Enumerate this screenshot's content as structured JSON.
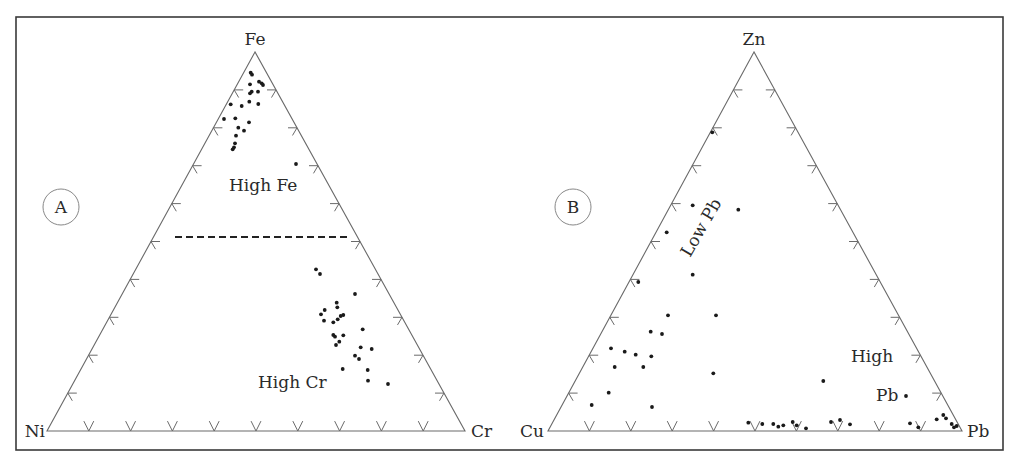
{
  "colors": {
    "background": "#ffffff",
    "frame": "#3a3a3a",
    "axis": "#6a6a6a",
    "point": "#1a1a1a",
    "text": "#2a2a2a"
  },
  "panels": [
    {
      "id": "A",
      "letter": "A",
      "letter_pos": [
        60,
        213
      ],
      "vertices": {
        "top": {
          "label": "Fe",
          "x": 255,
          "y": 52
        },
        "left": {
          "label": "Ni",
          "x": 47,
          "y": 431
        },
        "right": {
          "label": "Cr",
          "x": 465,
          "y": 431
        }
      },
      "regions": [
        {
          "label": "High Fe",
          "x": 229,
          "y": 191,
          "rotate": 0
        },
        {
          "label": "High Cr",
          "x": 258,
          "y": 388,
          "rotate": 0
        }
      ],
      "divider": {
        "style": "dashed",
        "x1": 175,
        "y1": 237,
        "x2": 351,
        "y2": 237
      },
      "points": [
        [
          250.7,
          72.7
        ],
        [
          252,
          74.7
        ],
        [
          259,
          81.7
        ],
        [
          261.7,
          83.3
        ],
        [
          263,
          85
        ],
        [
          250,
          84.3
        ],
        [
          251.7,
          91.7
        ],
        [
          250,
          93.3
        ],
        [
          258,
          91.7
        ],
        [
          249.3,
          101.7
        ],
        [
          258.3,
          104
        ],
        [
          230.7,
          104.3
        ],
        [
          241.7,
          106
        ],
        [
          224,
          119
        ],
        [
          235.3,
          118.3
        ],
        [
          249,
          122.3
        ],
        [
          238.3,
          127.7
        ],
        [
          244,
          130.7
        ],
        [
          236,
          135.7
        ],
        [
          235,
          143.3
        ],
        [
          234,
          147.3
        ],
        [
          232.7,
          149.3
        ],
        [
          296,
          164
        ],
        [
          316,
          269.3
        ],
        [
          320,
          274
        ],
        [
          355,
          294
        ],
        [
          336.7,
          302.7
        ],
        [
          337.3,
          307.3
        ],
        [
          324.7,
          310
        ],
        [
          321,
          314.3
        ],
        [
          343.3,
          315
        ],
        [
          340.7,
          316
        ],
        [
          337.7,
          319.3
        ],
        [
          333.3,
          322.3
        ],
        [
          324,
          320.7
        ],
        [
          362.7,
          329.3
        ],
        [
          333.3,
          335
        ],
        [
          335,
          336.7
        ],
        [
          343.3,
          335.3
        ],
        [
          339.3,
          341.7
        ],
        [
          336,
          345
        ],
        [
          360.7,
          347.3
        ],
        [
          371.7,
          349
        ],
        [
          355,
          355.7
        ],
        [
          359,
          359
        ],
        [
          342.7,
          369
        ],
        [
          367.7,
          370
        ],
        [
          368,
          380.7
        ],
        [
          388,
          384
        ]
      ]
    },
    {
      "id": "B",
      "letter": "B",
      "letter_pos": [
        572,
        213
      ],
      "vertices": {
        "top": {
          "label": "Zn",
          "x": 754,
          "y": 52
        },
        "left": {
          "label": "Cu",
          "x": 548,
          "y": 431
        },
        "right": {
          "label": "Pb",
          "x": 962,
          "y": 431
        }
      },
      "regions": [
        {
          "label": "Low Pb",
          "x": 706,
          "y": 232,
          "rotate": -60
        },
        {
          "label": "High",
          "x": 851,
          "y": 362,
          "rotate": 0
        },
        {
          "label": "Pb",
          "x": 877,
          "y": 401,
          "rotate": 0
        }
      ],
      "divider": null,
      "points": [
        [
          712.3,
          132.3
        ],
        [
          692.7,
          205.3
        ],
        [
          738.3,
          209.7
        ],
        [
          666.7,
          232.3
        ],
        [
          692.7,
          274.7
        ],
        [
          638.3,
          282
        ],
        [
          668,
          315.3
        ],
        [
          716,
          315.3
        ],
        [
          650.7,
          331.7
        ],
        [
          662,
          334
        ],
        [
          611,
          348.3
        ],
        [
          624.7,
          351.7
        ],
        [
          635.7,
          354.7
        ],
        [
          651.3,
          356.3
        ],
        [
          614.7,
          367
        ],
        [
          643.3,
          367
        ],
        [
          713.3,
          373.3
        ],
        [
          608.7,
          392.7
        ],
        [
          591.7,
          405
        ],
        [
          652,
          407
        ],
        [
          823.3,
          381
        ],
        [
          906,
          396
        ],
        [
          748.3,
          422.7
        ],
        [
          762.3,
          424
        ],
        [
          773.3,
          424
        ],
        [
          778.3,
          426.7
        ],
        [
          783.3,
          425.3
        ],
        [
          792.7,
          422
        ],
        [
          796.7,
          425.3
        ],
        [
          806,
          428.3
        ],
        [
          831,
          422
        ],
        [
          840,
          420
        ],
        [
          850,
          424.3
        ],
        [
          910,
          423.3
        ],
        [
          918.3,
          427.3
        ],
        [
          936.7,
          419.3
        ],
        [
          943.3,
          415
        ],
        [
          946,
          418.3
        ],
        [
          951.7,
          424
        ],
        [
          954,
          427.3
        ],
        [
          956.7,
          426
        ]
      ]
    }
  ],
  "chart_data": [
    {
      "type": "scatter",
      "subtype": "ternary",
      "title": "A",
      "axes": [
        "Fe",
        "Ni",
        "Cr"
      ],
      "apex": "Fe",
      "bottom_left": "Ni",
      "bottom_right": "Cr",
      "tick_interval_pct": 10,
      "annotations": [
        "High Fe",
        "High Cr"
      ],
      "divider": {
        "style": "dashed",
        "at_Fe_pct": 50
      },
      "grid": false,
      "approx_points_Fe_Ni_Cr_pct": [
        [
          94,
          4,
          2
        ],
        [
          94,
          3,
          3
        ],
        [
          92,
          3,
          5
        ],
        [
          92,
          3,
          5
        ],
        [
          91,
          2,
          7
        ],
        [
          92,
          5,
          3
        ],
        [
          90,
          5,
          5
        ],
        [
          89,
          6,
          5
        ],
        [
          90,
          4,
          6
        ],
        [
          87,
          7,
          6
        ],
        [
          86,
          5,
          9
        ],
        [
          86,
          10,
          4
        ],
        [
          86,
          7,
          7
        ],
        [
          82,
          13,
          5
        ],
        [
          82,
          10,
          8
        ],
        [
          81,
          7,
          12
        ],
        [
          80,
          10,
          10
        ],
        [
          79,
          8,
          13
        ],
        [
          78,
          11,
          11
        ],
        [
          76,
          12,
          12
        ],
        [
          75,
          12,
          13
        ],
        [
          75,
          13,
          12
        ],
        [
          70,
          8,
          22
        ],
        [
          42,
          22,
          36
        ],
        [
          41,
          22,
          37
        ],
        [
          36,
          16,
          48
        ],
        [
          34,
          22,
          44
        ],
        [
          33,
          22,
          45
        ],
        [
          32,
          26,
          42
        ],
        [
          31,
          27,
          42
        ],
        [
          31,
          21,
          48
        ],
        [
          30,
          22,
          48
        ],
        [
          29,
          23,
          48
        ],
        [
          29,
          24,
          47
        ],
        [
          29,
          27,
          44
        ],
        [
          27,
          18,
          55
        ],
        [
          25,
          26,
          49
        ],
        [
          25,
          25,
          50
        ],
        [
          25,
          23,
          52
        ],
        [
          24,
          24,
          52
        ],
        [
          23,
          25,
          52
        ],
        [
          22,
          19,
          59
        ],
        [
          22,
          16,
          62
        ],
        [
          20,
          21,
          59
        ],
        [
          19,
          20,
          61
        ],
        [
          16,
          25,
          59
        ],
        [
          16,
          19,
          65
        ],
        [
          13,
          20,
          67
        ],
        [
          12,
          15,
          73
        ]
      ]
    },
    {
      "type": "scatter",
      "subtype": "ternary",
      "title": "B",
      "axes": [
        "Zn",
        "Cu",
        "Pb"
      ],
      "apex": "Zn",
      "bottom_left": "Cu",
      "bottom_right": "Pb",
      "tick_interval_pct": 10,
      "annotations": [
        "Low Pb",
        "High Pb"
      ],
      "grid": false,
      "approx_points_Zn_Cu_Pb_pct": [
        [
          79,
          20,
          1
        ],
        [
          59,
          35,
          6
        ],
        [
          58,
          27,
          15
        ],
        [
          53,
          44,
          3
        ],
        [
          41,
          45,
          14
        ],
        [
          39,
          61,
          0
        ],
        [
          31,
          50,
          19
        ],
        [
          31,
          38,
          31
        ],
        [
          26,
          48,
          26
        ],
        [
          26,
          46,
          28
        ],
        [
          22,
          60,
          18
        ],
        [
          21,
          56,
          23
        ],
        [
          20,
          54,
          26
        ],
        [
          20,
          50,
          30
        ],
        [
          17,
          58,
          25
        ],
        [
          17,
          51,
          32
        ],
        [
          15,
          41,
          44
        ],
        [
          10,
          59,
          31
        ],
        [
          7,
          62,
          31
        ],
        [
          6,
          46,
          48
        ],
        [
          13,
          20,
          67
        ],
        [
          9,
          0,
          91
        ],
        [
          2,
          48,
          50
        ],
        [
          2,
          44,
          54
        ],
        [
          2,
          42,
          56
        ],
        [
          1,
          42,
          57
        ],
        [
          2,
          40,
          58
        ],
        [
          2,
          38,
          60
        ],
        [
          2,
          37,
          61
        ],
        [
          1,
          35,
          64
        ],
        [
          2,
          29,
          69
        ],
        [
          3,
          27,
          70
        ],
        [
          2,
          24,
          74
        ],
        [
          2,
          10,
          88
        ],
        [
          1,
          9,
          90
        ],
        [
          3,
          4,
          93
        ],
        [
          4,
          3,
          93
        ],
        [
          3,
          3,
          94
        ],
        [
          2,
          2,
          96
        ],
        [
          1,
          2,
          97
        ],
        [
          1,
          1,
          98
        ]
      ]
    }
  ]
}
